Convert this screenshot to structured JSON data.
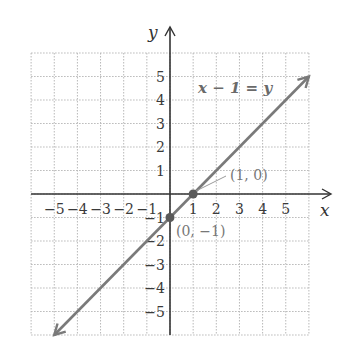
{
  "chart_data": {
    "type": "line",
    "title": "",
    "xlabel": "x",
    "ylabel": "y",
    "xlim": [
      -6,
      6
    ],
    "ylim": [
      -6,
      6
    ],
    "grid": true,
    "x_ticks": [
      -5,
      -4,
      -3,
      -2,
      -1,
      1,
      2,
      3,
      4,
      5
    ],
    "y_ticks": [
      -5,
      -4,
      -3,
      -2,
      -1,
      1,
      2,
      3,
      4,
      5
    ],
    "x_tick_labels": [
      "−5",
      "−4",
      "−3",
      "−2",
      "−1",
      "1",
      "2",
      "3",
      "4",
      "5"
    ],
    "y_tick_labels": [
      "−5",
      "−4",
      "−3",
      "−2",
      "−1",
      "1",
      "2",
      "3",
      "4",
      "5"
    ],
    "series": [
      {
        "name": "x − 1 = y",
        "equation": "x − 1 = y",
        "x": [
          -5,
          6
        ],
        "y": [
          -6,
          5
        ],
        "arrows": "both",
        "color": "#7a7a7a"
      }
    ],
    "points": [
      {
        "x": 1,
        "y": 0,
        "label": "(1, 0)"
      },
      {
        "x": 0,
        "y": -1,
        "label": "(0, −1)"
      }
    ],
    "annotations": [
      {
        "text": "x − 1 = y",
        "x": 2.3,
        "y": 4.5
      }
    ]
  },
  "labels": {
    "x_axis": "x",
    "y_axis": "y",
    "equation": "x − 1 = y",
    "point_a": "(1, 0)",
    "point_b": "(0, −1)"
  }
}
